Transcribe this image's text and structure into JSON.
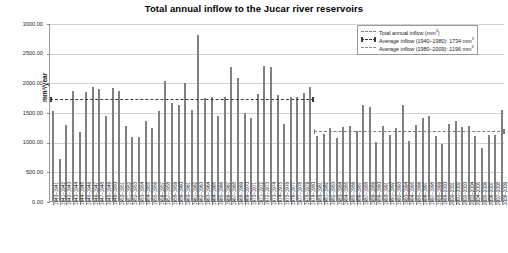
{
  "chart_data": {
    "type": "bar",
    "title": "Total annual inflow to the Jucar river reservoirs",
    "xlabel": "",
    "ylabel": "mm³/year",
    "ylim": [
      0,
      3000
    ],
    "ytick_step": 500,
    "ytick_labels": [
      "3000.00",
      "2500.00",
      "2000.00",
      "1500.00",
      "1000.00",
      "500.00",
      "0.00"
    ],
    "grid": true,
    "legend_position": "top-right",
    "legend": [
      {
        "label": "Total annual inflow (mm³)",
        "key": "bar-swatch",
        "color": "#808080"
      },
      {
        "label": "Average inflow (1940–1980): 1734 mm³",
        "key": "dashed-line-capped",
        "color": "#3a3a3a"
      },
      {
        "label": "Average inflow (1980–2009): 1196 mm³",
        "key": "dashed-line",
        "color": "#8e8e8e"
      }
    ],
    "series": [
      {
        "name": "Total annual inflow (mm³)",
        "color": "#808080",
        "values": [
          1520,
          700,
          1280,
          1860,
          1160,
          1840,
          1920,
          1880,
          1430,
          1900,
          1850,
          1270,
          1080,
          1080,
          1350,
          1230,
          1520,
          2020,
          1650,
          1620,
          1990,
          1540,
          2790,
          1740,
          1750,
          1430,
          1760,
          2260,
          2080,
          1490,
          1400,
          1800,
          2270,
          2260,
          1780,
          1300,
          1750,
          1760,
          1820,
          1930,
          1100,
          1130,
          1230,
          1060,
          1250,
          1260,
          1180,
          1620,
          1580,
          1000,
          1270,
          1120,
          1230,
          1610,
          1010,
          1280,
          1400,
          1430,
          1100,
          960,
          1290,
          1350,
          1240,
          1260,
          1090,
          890,
          1110,
          1120,
          1530
        ]
      }
    ],
    "reference_lines": [
      {
        "name": "Average inflow (1940–1980)",
        "value": 1734,
        "from_index": 0,
        "to_index": 39,
        "style": "dashed-capped",
        "color": "#3a3a3a"
      },
      {
        "name": "Average inflow (1980–2009)",
        "value": 1196,
        "from_index": 40,
        "to_index": 68,
        "style": "dashed",
        "color": "#8e8e8e"
      }
    ],
    "categories": [
      "1940–1941",
      "1941–1942",
      "1942–1943",
      "1943–1944",
      "1944–1945",
      "1945–1946",
      "1946–1947",
      "1947–1948",
      "1948–1949",
      "1949–1950",
      "1950–1951",
      "1951–1952",
      "1952–1953",
      "1953–1954",
      "1954–1955",
      "1955–1956",
      "1956–1957",
      "1957–1958",
      "1958–1959",
      "1959–1960",
      "1960–1961",
      "1961–1962",
      "1962–1963",
      "1963–1964",
      "1964–1965",
      "1965–1966",
      "1966–1967",
      "1967–1968",
      "1968–1969",
      "1969–1970",
      "1970–1971",
      "1971–1972",
      "1972–1973",
      "1973–1974",
      "1974–1975",
      "1975–1976",
      "1976–1977",
      "1977–1978",
      "1978–1979",
      "1979–1980",
      "1980–1981",
      "1981–1982",
      "1982–1983",
      "1983–1984",
      "1984–1985",
      "1985–1986",
      "1986–1987",
      "1987–1988",
      "1988–1989",
      "1989–1990",
      "1990–1991",
      "1991–1992",
      "1992–1993",
      "1993–1994",
      "1994–1995",
      "1995–1996",
      "1996–1997",
      "1997–1998",
      "1998–1999",
      "1999–2000",
      "2000–2001",
      "2001–2002",
      "2002–2003",
      "2003–2004",
      "2004–2005",
      "2005–2006",
      "2006–2007",
      "2007–2008",
      "2008–2009"
    ]
  }
}
